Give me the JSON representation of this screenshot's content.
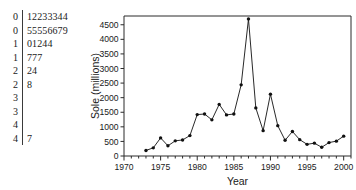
{
  "stemleaf": {
    "name": "stem-and-leaf-plot",
    "rows": [
      {
        "stem": "0",
        "leaf": "12233344"
      },
      {
        "stem": "0",
        "leaf": "55556679"
      },
      {
        "stem": "1",
        "leaf": "01244"
      },
      {
        "stem": "1",
        "leaf": "777"
      },
      {
        "stem": "2",
        "leaf": "24"
      },
      {
        "stem": "2",
        "leaf": "8"
      },
      {
        "stem": "3",
        "leaf": ""
      },
      {
        "stem": "3",
        "leaf": ""
      },
      {
        "stem": "4",
        "leaf": ""
      },
      {
        "stem": "4",
        "leaf": "7"
      }
    ]
  },
  "chart_data": {
    "type": "line",
    "title": "",
    "xlabel": "Year",
    "ylabel": "Sole (millions)",
    "xlim": [
      1970,
      2001
    ],
    "ylim": [
      0,
      4800
    ],
    "xticks": [
      1970,
      1975,
      1980,
      1985,
      1990,
      1995,
      2000
    ],
    "xticklabels": [
      "1970",
      "1975",
      "1980",
      "1985",
      "1990",
      "1995",
      "2000"
    ],
    "xminorstep": 1,
    "yticks": [
      0,
      500,
      1000,
      1500,
      2000,
      2500,
      3000,
      3500,
      4000,
      4500
    ],
    "yticklabels": [
      "0",
      "500",
      "1000",
      "1500",
      "2000",
      "2500",
      "3000",
      "3500",
      "4000",
      "4500"
    ],
    "grid": false,
    "legend": null,
    "series": [
      {
        "name": "Sole",
        "x": [
          1973,
          1974,
          1975,
          1976,
          1977,
          1978,
          1979,
          1980,
          1981,
          1982,
          1983,
          1984,
          1985,
          1986,
          1987,
          1988,
          1989,
          1990,
          1991,
          1992,
          1993,
          1994,
          1995,
          1996,
          1997,
          1998,
          1999,
          2000
        ],
        "values": [
          190,
          280,
          620,
          350,
          520,
          550,
          700,
          1420,
          1440,
          1240,
          1770,
          1410,
          1440,
          2440,
          4700,
          1650,
          870,
          2120,
          1040,
          540,
          840,
          560,
          400,
          440,
          300,
          460,
          510,
          680
        ]
      }
    ]
  }
}
